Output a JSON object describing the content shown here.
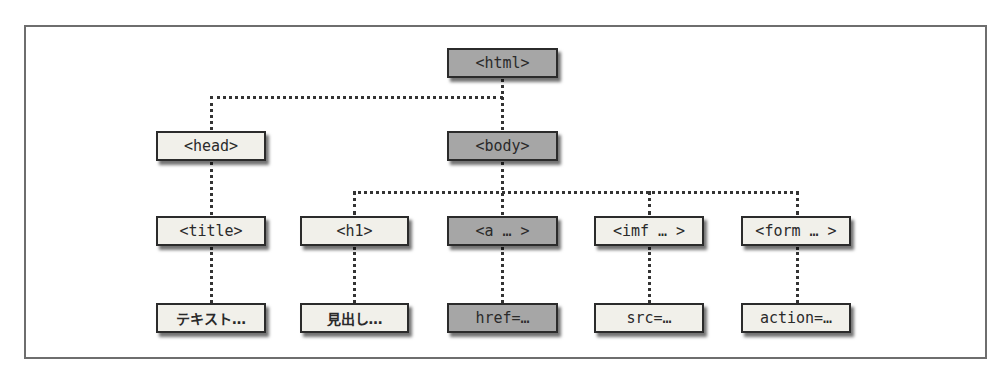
{
  "diagram": {
    "colors": {
      "highlight": "#a6a6a6",
      "normal": "#f1f0ea",
      "border": "#2b2b2b",
      "connector": "#333333"
    },
    "nodes": {
      "html": {
        "label": "<html>",
        "highlight": true
      },
      "head": {
        "label": "<head>",
        "highlight": false
      },
      "body": {
        "label": "<body>",
        "highlight": true
      },
      "title": {
        "label": "<title>",
        "highlight": false
      },
      "h1": {
        "label": "<h1>",
        "highlight": false
      },
      "a": {
        "label": "<a … >",
        "highlight": true
      },
      "imf": {
        "label": "<imf … >",
        "highlight": false
      },
      "form": {
        "label": "<form … >",
        "highlight": false
      },
      "text": {
        "label": "テキスト…",
        "highlight": false
      },
      "heading": {
        "label": "見出し…",
        "highlight": false
      },
      "href": {
        "label": "href=…",
        "highlight": true
      },
      "src": {
        "label": "src=…",
        "highlight": false
      },
      "action": {
        "label": "action=…",
        "highlight": false
      }
    },
    "edges": [
      [
        "html",
        "head"
      ],
      [
        "html",
        "body"
      ],
      [
        "head",
        "title"
      ],
      [
        "body",
        "h1"
      ],
      [
        "body",
        "a"
      ],
      [
        "body",
        "imf"
      ],
      [
        "body",
        "form"
      ],
      [
        "title",
        "text"
      ],
      [
        "h1",
        "heading"
      ],
      [
        "a",
        "href"
      ],
      [
        "imf",
        "src"
      ],
      [
        "form",
        "action"
      ]
    ]
  }
}
